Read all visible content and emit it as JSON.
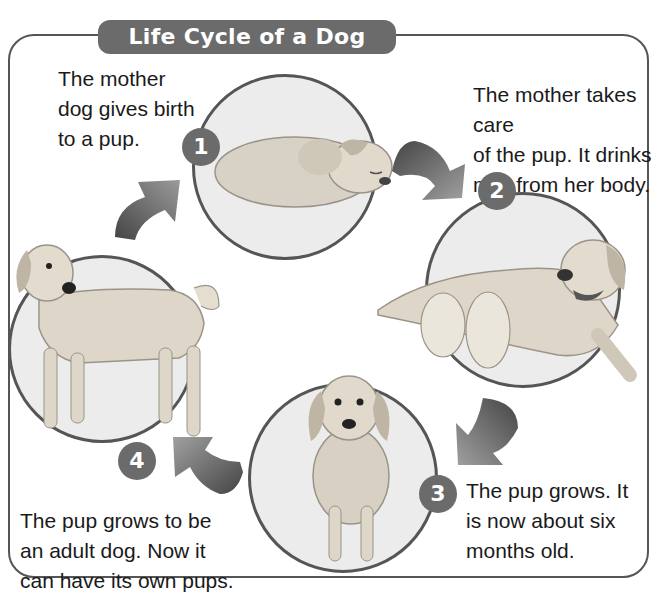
{
  "title": "Life Cycle of a Dog",
  "stages": [
    {
      "number": "1",
      "text_lines": [
        "The mother",
        "dog gives birth",
        "to a pup."
      ],
      "image": "newborn-puppy-sleeping"
    },
    {
      "number": "2",
      "text_lines": [
        "The mother takes care",
        "of the pup. It drinks",
        "milk from her body."
      ],
      "image": "mother-dog-nursing-puppies"
    },
    {
      "number": "3",
      "text_lines": [
        "The pup grows. It",
        "is now about six",
        "months old."
      ],
      "image": "six-month-old-puppy-sitting"
    },
    {
      "number": "4",
      "text_lines": [
        "The pup grows to be",
        "an adult dog. Now it",
        "can have its own pups."
      ],
      "image": "adult-dog-standing"
    }
  ],
  "arrows": [
    "arrow-1-to-2",
    "arrow-2-to-3",
    "arrow-3-to-4",
    "arrow-4-to-1"
  ],
  "colors": {
    "banner": "#6b6b6b",
    "badge": "#6b6b6b",
    "border": "#555555",
    "circle_fill": "#ececec"
  }
}
